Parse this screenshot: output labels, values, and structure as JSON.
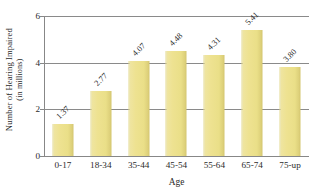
{
  "chart_data": {
    "type": "bar",
    "title": "",
    "subtitle": "",
    "xlabel": "Age",
    "ylabel": "Number of Hearing Impaired (in millions)",
    "ylabel_line1": "Number of Hearing Impaired",
    "ylabel_line2": "(in millions)",
    "categories": [
      "0-17",
      "18-34",
      "35-44",
      "45-54",
      "55-64",
      "65-74",
      "75-up"
    ],
    "values": [
      1.37,
      2.77,
      4.07,
      4.48,
      4.31,
      5.41,
      3.8
    ],
    "value_labels": [
      "1.37",
      "2.77",
      "4.07",
      "4.48",
      "4.31",
      "5.41",
      "3.80"
    ],
    "ylim": [
      0,
      6
    ],
    "yticks": [
      0,
      2,
      4,
      6
    ],
    "ytick_labels": [
      "0",
      "2",
      "4",
      "6"
    ],
    "grid": "horizontal",
    "legend": "none",
    "bar_color": "#ecdf8e",
    "bar_edge_color": "#d3c56e",
    "axis_color": "#878787",
    "grid_color": "#8a8a8a",
    "background_color": "#ffffff",
    "text_color": "#2b2b2b",
    "value_label_rotation": 45
  }
}
